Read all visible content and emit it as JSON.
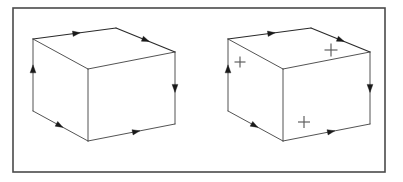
{
  "figure": {
    "background_color": "#ffffff",
    "frame": {
      "label": "diagram-border",
      "x": 13,
      "y": 8,
      "width": 372,
      "height": 164,
      "stroke_color": "#4a4a4a",
      "stroke_width": 1.6
    },
    "edge_color": "#404040",
    "arrow_color": "#1a1a1a",
    "plus_color": "#5a5a5a"
  },
  "boxes": [
    {
      "id": "left-box",
      "label": "Box without face markers",
      "marker_count": 0,
      "vertices": {
        "top_back_left": [
          33,
          39
        ],
        "top_back_right": [
          116,
          28
        ],
        "top_front_right": [
          175,
          52
        ],
        "top_front_left": [
          88,
          69
        ],
        "bottom_front_left": [
          88,
          141
        ],
        "bottom_back_left": [
          33,
          111
        ],
        "bottom_front_right": [
          175,
          124
        ]
      },
      "edges": [
        {
          "name": "top-rear-left-edge",
          "from": "top_back_left",
          "to": "top_back_right",
          "direction": "forward",
          "has_arrow": true,
          "arrow_t": 0.52
        },
        {
          "name": "top-rear-right-edge",
          "from": "top_back_right",
          "to": "top_front_right",
          "direction": "forward",
          "has_arrow": true,
          "arrow_t": 0.5
        },
        {
          "name": "top-front-right-edge",
          "from": "top_front_left",
          "to": "top_front_right",
          "direction": "forward",
          "has_arrow": false,
          "arrow_t": 0.5
        },
        {
          "name": "top-front-left-edge",
          "from": "top_back_left",
          "to": "top_front_left",
          "direction": "forward",
          "has_arrow": false,
          "arrow_t": 0.5
        },
        {
          "name": "left-vertical-edge",
          "from": "bottom_back_left",
          "to": "top_back_left",
          "direction": "up",
          "has_arrow": true,
          "arrow_t": 0.58
        },
        {
          "name": "right-vertical-edge",
          "from": "top_front_right",
          "to": "bottom_front_right",
          "direction": "down",
          "has_arrow": true,
          "arrow_t": 0.5
        },
        {
          "name": "center-vertical-edge",
          "from": "top_front_left",
          "to": "bottom_front_left",
          "direction": "none",
          "has_arrow": false,
          "arrow_t": 0.5
        },
        {
          "name": "bottom-left-edge",
          "from": "bottom_back_left",
          "to": "bottom_front_left",
          "direction": "forward",
          "has_arrow": true,
          "arrow_t": 0.48
        },
        {
          "name": "bottom-right-edge",
          "from": "bottom_front_left",
          "to": "bottom_front_right",
          "direction": "forward",
          "has_arrow": true,
          "arrow_t": 0.55
        }
      ],
      "plus_markers": []
    },
    {
      "id": "right-box",
      "label": "Box with three face markers",
      "marker_count": 3,
      "vertices": {
        "top_back_left": [
          228,
          39
        ],
        "top_back_right": [
          311,
          28
        ],
        "top_front_right": [
          370,
          52
        ],
        "top_front_left": [
          283,
          69
        ],
        "bottom_front_left": [
          283,
          141
        ],
        "bottom_back_left": [
          228,
          111
        ],
        "bottom_front_right": [
          370,
          124
        ]
      },
      "edges": [
        {
          "name": "top-rear-left-edge",
          "from": "top_back_left",
          "to": "top_back_right",
          "direction": "forward",
          "has_arrow": true,
          "arrow_t": 0.52
        },
        {
          "name": "top-rear-right-edge",
          "from": "top_back_right",
          "to": "top_front_right",
          "direction": "forward",
          "has_arrow": true,
          "arrow_t": 0.5
        },
        {
          "name": "top-front-right-edge",
          "from": "top_front_left",
          "to": "top_front_right",
          "direction": "forward",
          "has_arrow": false,
          "arrow_t": 0.5
        },
        {
          "name": "top-front-left-edge",
          "from": "top_back_left",
          "to": "top_front_left",
          "direction": "forward",
          "has_arrow": false,
          "arrow_t": 0.5
        },
        {
          "name": "left-vertical-edge",
          "from": "bottom_back_left",
          "to": "top_back_left",
          "direction": "up",
          "has_arrow": true,
          "arrow_t": 0.58
        },
        {
          "name": "right-vertical-edge",
          "from": "top_front_right",
          "to": "bottom_front_right",
          "direction": "down",
          "has_arrow": true,
          "arrow_t": 0.5
        },
        {
          "name": "center-vertical-edge",
          "from": "top_front_left",
          "to": "bottom_front_left",
          "direction": "none",
          "has_arrow": false,
          "arrow_t": 0.5
        },
        {
          "name": "bottom-left-edge",
          "from": "bottom_back_left",
          "to": "bottom_front_left",
          "direction": "forward",
          "has_arrow": true,
          "arrow_t": 0.48
        },
        {
          "name": "bottom-right-edge",
          "from": "bottom_front_left",
          "to": "bottom_front_right",
          "direction": "forward",
          "has_arrow": true,
          "arrow_t": 0.55
        }
      ],
      "plus_markers": [
        {
          "name": "plus-marker-left-face",
          "face": "left",
          "symbol": "+",
          "x": 240,
          "y": 62,
          "size": 11
        },
        {
          "name": "plus-marker-top-face",
          "face": "top",
          "symbol": "+",
          "x": 331,
          "y": 50,
          "size": 13
        },
        {
          "name": "plus-marker-front-face",
          "face": "front",
          "symbol": "+",
          "x": 304,
          "y": 122,
          "size": 12
        }
      ]
    }
  ],
  "artifacts": [
    {
      "name": "scan-smudge",
      "points": "240,118 262,150 270,160"
    }
  ]
}
